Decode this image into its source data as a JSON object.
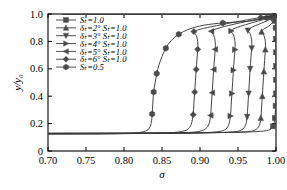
{
  "chart_data": {
    "type": "line",
    "title": "",
    "xlabel": "σ",
    "ylabel": "y/y₀",
    "xlim": [
      0.7,
      1.0
    ],
    "ylim": [
      0.0,
      1.0
    ],
    "xticks": [
      0.7,
      0.75,
      0.8,
      0.85,
      0.9,
      0.95,
      1.0
    ],
    "xticklabels": [
      "0.70",
      "0.75",
      "0.80",
      "0.85",
      "0.90",
      "0.95",
      "1.00"
    ],
    "yticks": [
      0.0,
      0.2,
      0.4,
      0.6,
      0.8,
      1.0
    ],
    "yticklabels": [
      "0",
      "0.2",
      "0.4",
      "0.6",
      "0.8",
      "1.0"
    ],
    "grid": false,
    "legend_position": "upper-left",
    "line_color": "#3a3a3a",
    "marker_color": "#4a4a4a",
    "axis_color": "#000000",
    "series": [
      {
        "name": "S_t=1.0",
        "label": "Sₜ=1.0",
        "marker": "square",
        "points": [
          [
            0.7,
            0.13
          ],
          [
            0.8,
            0.131
          ],
          [
            0.86,
            0.132
          ],
          [
            0.91,
            0.134
          ],
          [
            0.95,
            0.137
          ],
          [
            0.975,
            0.142
          ],
          [
            0.99,
            0.152
          ],
          [
            0.996,
            0.18
          ],
          [
            0.9985,
            0.24
          ],
          [
            0.9995,
            0.33
          ],
          [
            1.0,
            0.42
          ],
          [
            1.0,
            0.52
          ],
          [
            1.0,
            0.62
          ],
          [
            1.0,
            0.72
          ],
          [
            1.0,
            0.82
          ],
          [
            0.9995,
            0.9
          ],
          [
            0.9985,
            0.95
          ],
          [
            0.997,
            0.975
          ],
          [
            0.993,
            0.99
          ],
          [
            0.985,
            0.996
          ],
          [
            0.96,
            0.999
          ],
          [
            0.9,
            1.0
          ],
          [
            0.82,
            1.0
          ],
          [
            0.76,
            1.0
          ],
          [
            0.72,
            1.0
          ]
        ],
        "markers_at": [
          [
            1.0,
            0.42
          ],
          [
            1.0,
            0.52
          ],
          [
            1.0,
            0.62
          ],
          [
            1.0,
            0.72
          ],
          [
            1.0,
            0.82
          ],
          [
            0.9995,
            0.9
          ],
          [
            0.9985,
            0.95
          ],
          [
            0.996,
            0.18
          ],
          [
            0.9985,
            0.24
          ],
          [
            0.9995,
            0.33
          ]
        ]
      },
      {
        "name": "delta_T=2deg, S_t=1.0",
        "label": "δₜ=2° Sₜ=1.0",
        "marker": "triangle-up",
        "points": [
          [
            0.7,
            0.129
          ],
          [
            0.8,
            0.13
          ],
          [
            0.88,
            0.132
          ],
          [
            0.93,
            0.135
          ],
          [
            0.96,
            0.14
          ],
          [
            0.972,
            0.152
          ],
          [
            0.978,
            0.185
          ],
          [
            0.98,
            0.24
          ],
          [
            0.981,
            0.32
          ],
          [
            0.982,
            0.4
          ],
          [
            0.983,
            0.49
          ],
          [
            0.984,
            0.58
          ],
          [
            0.985,
            0.66
          ],
          [
            0.986,
            0.74
          ],
          [
            0.986,
            0.8
          ],
          [
            0.984,
            0.845
          ],
          [
            0.981,
            0.87
          ],
          [
            0.984,
            0.89
          ],
          [
            0.99,
            0.91
          ],
          [
            0.995,
            0.935
          ],
          [
            0.998,
            0.96
          ],
          [
            0.999,
            0.98
          ],
          [
            0.998,
            0.992
          ],
          [
            0.99,
            0.997
          ],
          [
            0.96,
            0.999
          ],
          [
            0.9,
            1.0
          ],
          [
            0.8,
            1.0
          ],
          [
            0.72,
            1.0
          ]
        ],
        "markers_at": [
          [
            0.98,
            0.24
          ],
          [
            0.982,
            0.4
          ],
          [
            0.984,
            0.58
          ],
          [
            0.986,
            0.74
          ],
          [
            0.981,
            0.87
          ],
          [
            0.999,
            0.98
          ]
        ]
      },
      {
        "name": "delta_T=3deg, S_t=1.0",
        "label": "δₜ=3° Sₜ=1.0",
        "marker": "triangle-down",
        "points": [
          [
            0.7,
            0.128
          ],
          [
            0.8,
            0.129
          ],
          [
            0.88,
            0.131
          ],
          [
            0.92,
            0.134
          ],
          [
            0.945,
            0.14
          ],
          [
            0.955,
            0.155
          ],
          [
            0.96,
            0.19
          ],
          [
            0.962,
            0.25
          ],
          [
            0.963,
            0.33
          ],
          [
            0.964,
            0.42
          ],
          [
            0.965,
            0.51
          ],
          [
            0.966,
            0.6
          ],
          [
            0.967,
            0.68
          ],
          [
            0.968,
            0.75
          ],
          [
            0.968,
            0.81
          ],
          [
            0.966,
            0.855
          ],
          [
            0.963,
            0.88
          ],
          [
            0.967,
            0.9
          ],
          [
            0.976,
            0.922
          ],
          [
            0.986,
            0.945
          ],
          [
            0.994,
            0.968
          ],
          [
            0.998,
            0.985
          ],
          [
            0.996,
            0.994
          ],
          [
            0.985,
            0.998
          ],
          [
            0.95,
            1.0
          ],
          [
            0.88,
            1.0
          ],
          [
            0.79,
            1.0
          ],
          [
            0.72,
            1.0
          ]
        ],
        "markers_at": [
          [
            0.962,
            0.25
          ],
          [
            0.964,
            0.42
          ],
          [
            0.966,
            0.6
          ],
          [
            0.968,
            0.75
          ],
          [
            0.963,
            0.88
          ],
          [
            0.994,
            0.968
          ]
        ]
      },
      {
        "name": "delta_T=4deg, S_t=1.0",
        "label": "δₜ=4° Sₜ=1.0",
        "marker": "triangle-right",
        "points": [
          [
            0.7,
            0.127
          ],
          [
            0.8,
            0.128
          ],
          [
            0.87,
            0.13
          ],
          [
            0.905,
            0.134
          ],
          [
            0.925,
            0.142
          ],
          [
            0.934,
            0.16
          ],
          [
            0.938,
            0.195
          ],
          [
            0.94,
            0.255
          ],
          [
            0.941,
            0.335
          ],
          [
            0.942,
            0.42
          ],
          [
            0.943,
            0.505
          ],
          [
            0.944,
            0.59
          ],
          [
            0.945,
            0.67
          ],
          [
            0.946,
            0.74
          ],
          [
            0.946,
            0.8
          ],
          [
            0.944,
            0.848
          ],
          [
            0.941,
            0.876
          ],
          [
            0.947,
            0.898
          ],
          [
            0.96,
            0.922
          ],
          [
            0.976,
            0.948
          ],
          [
            0.99,
            0.97
          ],
          [
            0.997,
            0.987
          ],
          [
            0.994,
            0.995
          ],
          [
            0.98,
            0.999
          ],
          [
            0.94,
            1.0
          ],
          [
            0.87,
            1.0
          ],
          [
            0.78,
            1.0
          ],
          [
            0.72,
            1.0
          ]
        ],
        "markers_at": [
          [
            0.94,
            0.255
          ],
          [
            0.942,
            0.42
          ],
          [
            0.944,
            0.59
          ],
          [
            0.946,
            0.74
          ],
          [
            0.941,
            0.876
          ],
          [
            0.99,
            0.97
          ]
        ]
      },
      {
        "name": "delta_T=5deg, S_t=1.0",
        "label": "δₜ=5° Sₜ=1.0",
        "marker": "triangle-left",
        "points": [
          [
            0.7,
            0.126
          ],
          [
            0.79,
            0.127
          ],
          [
            0.85,
            0.13
          ],
          [
            0.885,
            0.135
          ],
          [
            0.9,
            0.145
          ],
          [
            0.908,
            0.165
          ],
          [
            0.912,
            0.2
          ],
          [
            0.914,
            0.26
          ],
          [
            0.915,
            0.34
          ],
          [
            0.916,
            0.425
          ],
          [
            0.917,
            0.51
          ],
          [
            0.918,
            0.595
          ],
          [
            0.919,
            0.672
          ],
          [
            0.92,
            0.742
          ],
          [
            0.92,
            0.8
          ],
          [
            0.918,
            0.846
          ],
          [
            0.915,
            0.874
          ],
          [
            0.924,
            0.896
          ],
          [
            0.942,
            0.922
          ],
          [
            0.965,
            0.95
          ],
          [
            0.985,
            0.973
          ],
          [
            0.996,
            0.989
          ],
          [
            0.992,
            0.996
          ],
          [
            0.975,
            0.999
          ],
          [
            0.93,
            1.0
          ],
          [
            0.86,
            1.0
          ],
          [
            0.775,
            1.0
          ],
          [
            0.72,
            1.0
          ]
        ],
        "markers_at": [
          [
            0.914,
            0.26
          ],
          [
            0.916,
            0.425
          ],
          [
            0.918,
            0.595
          ],
          [
            0.92,
            0.742
          ],
          [
            0.915,
            0.874
          ],
          [
            0.985,
            0.973
          ]
        ]
      },
      {
        "name": "delta_T=6deg, S_t=1.0",
        "label": "δₜ=6° Sₜ=1.0",
        "marker": "diamond",
        "points": [
          [
            0.7,
            0.125
          ],
          [
            0.78,
            0.126
          ],
          [
            0.835,
            0.129
          ],
          [
            0.865,
            0.135
          ],
          [
            0.88,
            0.148
          ],
          [
            0.886,
            0.17
          ],
          [
            0.889,
            0.205
          ],
          [
            0.891,
            0.265
          ],
          [
            0.892,
            0.345
          ],
          [
            0.893,
            0.43
          ],
          [
            0.894,
            0.512
          ],
          [
            0.895,
            0.595
          ],
          [
            0.896,
            0.672
          ],
          [
            0.897,
            0.742
          ],
          [
            0.897,
            0.8
          ],
          [
            0.895,
            0.845
          ],
          [
            0.892,
            0.872
          ],
          [
            0.905,
            0.895
          ],
          [
            0.928,
            0.922
          ],
          [
            0.956,
            0.951
          ],
          [
            0.98,
            0.975
          ],
          [
            0.995,
            0.99
          ],
          [
            0.99,
            0.997
          ],
          [
            0.97,
            0.999
          ],
          [
            0.92,
            1.0
          ],
          [
            0.85,
            1.0
          ],
          [
            0.77,
            1.0
          ],
          [
            0.72,
            1.0
          ]
        ],
        "markers_at": [
          [
            0.891,
            0.265
          ],
          [
            0.893,
            0.43
          ],
          [
            0.895,
            0.595
          ],
          [
            0.897,
            0.742
          ],
          [
            0.892,
            0.872
          ],
          [
            0.98,
            0.975
          ]
        ]
      },
      {
        "name": "S_t=0.5",
        "label": "Sₜ=0.5",
        "marker": "hexagon",
        "points": [
          [
            0.7,
            0.124
          ],
          [
            0.76,
            0.125
          ],
          [
            0.8,
            0.128
          ],
          [
            0.82,
            0.135
          ],
          [
            0.83,
            0.15
          ],
          [
            0.834,
            0.175
          ],
          [
            0.836,
            0.21
          ],
          [
            0.837,
            0.27
          ],
          [
            0.838,
            0.35
          ],
          [
            0.839,
            0.43
          ],
          [
            0.841,
            0.5
          ],
          [
            0.843,
            0.565
          ],
          [
            0.846,
            0.628
          ],
          [
            0.85,
            0.69
          ],
          [
            0.855,
            0.75
          ],
          [
            0.862,
            0.805
          ],
          [
            0.872,
            0.852
          ],
          [
            0.886,
            0.89
          ],
          [
            0.905,
            0.918
          ],
          [
            0.93,
            0.935
          ],
          [
            0.95,
            0.942
          ],
          [
            0.965,
            0.948
          ],
          [
            0.98,
            0.962
          ],
          [
            0.992,
            0.98
          ],
          [
            0.998,
            0.993
          ],
          [
            0.99,
            0.998
          ],
          [
            0.96,
            1.0
          ],
          [
            0.9,
            1.0
          ],
          [
            0.82,
            1.0
          ],
          [
            0.75,
            1.0
          ]
        ],
        "markers_at": [
          [
            0.837,
            0.27
          ],
          [
            0.839,
            0.43
          ],
          [
            0.843,
            0.565
          ],
          [
            0.855,
            0.75
          ],
          [
            0.872,
            0.852
          ],
          [
            0.93,
            0.935
          ]
        ]
      }
    ]
  },
  "legend": {
    "entries": [
      {
        "label": "Sₜ=1.0",
        "marker": "square"
      },
      {
        "label": "δₜ=2° Sₜ=1.0",
        "marker": "triangle-up"
      },
      {
        "label": "δₜ=3° Sₜ=1.0",
        "marker": "triangle-down"
      },
      {
        "label": "δₜ=4° Sₜ=1.0",
        "marker": "triangle-right"
      },
      {
        "label": "δₜ=5° Sₜ=1.0",
        "marker": "triangle-left"
      },
      {
        "label": "δₜ=6° Sₜ=1.0",
        "marker": "diamond"
      },
      {
        "label": "Sₜ=0.5",
        "marker": "hexagon"
      }
    ]
  }
}
